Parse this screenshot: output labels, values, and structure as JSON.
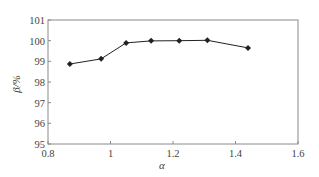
{
  "chart_data": {
    "type": "line",
    "title": "",
    "xlabel": "α",
    "ylabel": "β/%",
    "xlim": [
      0.8,
      1.6
    ],
    "ylim": [
      95,
      101
    ],
    "xticks": [
      0.8,
      1,
      1.2,
      1.4,
      1.6
    ],
    "xtick_labels": [
      "0.8",
      "1",
      "1.2",
      "1.4",
      "1.6"
    ],
    "yticks": [
      95,
      96,
      97,
      98,
      99,
      100,
      101
    ],
    "ytick_labels": [
      "95",
      "96",
      "97",
      "98",
      "99",
      "100",
      "101"
    ],
    "grid": false,
    "legend": null,
    "series": [
      {
        "name": "β",
        "marker": "diamond",
        "color": "#222222",
        "x": [
          0.87,
          0.97,
          1.05,
          1.13,
          1.22,
          1.31,
          1.44
        ],
        "y": [
          98.87,
          99.12,
          99.89,
          99.99,
          100.0,
          100.02,
          99.65
        ]
      }
    ]
  },
  "colors": {
    "axis": "#8a8a8a",
    "line": "#222222",
    "text": "#444444"
  }
}
